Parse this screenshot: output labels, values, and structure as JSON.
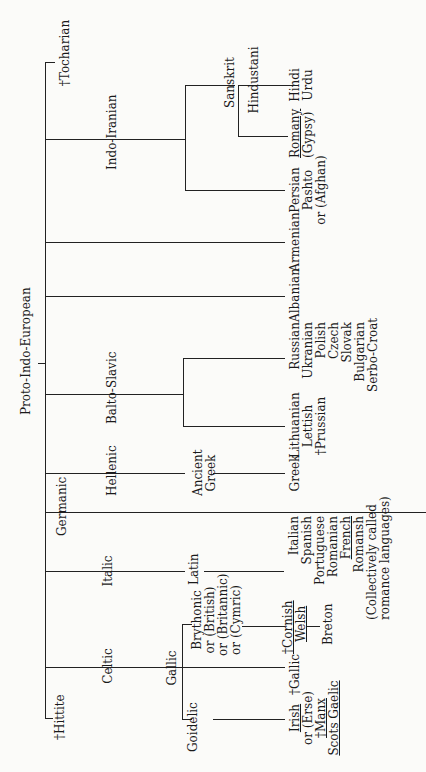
{
  "diagram": {
    "title": "Proto-Indo-European",
    "orientation": "rotated -90deg (root at left, leaves at right)",
    "branches": {
      "tocharian": "†Tocharian",
      "indo_iranian": "Indo-Iranian",
      "sanskrit": "Sanskrit",
      "hindustani": "Hindustani",
      "hindi_urdu": [
        "Hindi",
        "Urdu"
      ],
      "romany": [
        "Romany",
        "(Gypsy)"
      ],
      "persian": [
        "Persian",
        "Pashto",
        "or (Afghan)"
      ],
      "armenian": "Armenian",
      "albanian": "Albanian",
      "balto_slavic": "Balto-Slavic",
      "slavic": [
        "Russian",
        "Ukranian",
        "Polish",
        "Czech",
        "Slovak",
        "Bulgarian",
        "Serbo-Croat"
      ],
      "baltic": [
        "Lithuanian",
        "Lettish",
        "†Prussian"
      ],
      "hellenic": "Hellenic",
      "ancient_greek": [
        "Ancient",
        "Greek"
      ],
      "greek": "Greek",
      "germanic": "Germanic",
      "italic": "Italic",
      "latin": "Latin",
      "romance": [
        "Italian",
        "Spanish",
        "Portuguese",
        "Romanian",
        "French",
        "Romansh",
        "(Collectively called",
        "romance languages)"
      ],
      "celtic": "Celtic",
      "gallic": "Gallic",
      "brythonic": [
        "Brythonic",
        "or (British)",
        "or (Britannic)",
        "or (Cymric)"
      ],
      "cornish_welsh": [
        "†Cornish",
        "Welsh"
      ],
      "breton": "Breton",
      "gallic_extinct": "†Gallic",
      "goidelic": "Goidelic",
      "goidelic_langs": [
        "Irish",
        "or (Erse)",
        "†Manx",
        "Scots Gaelic"
      ],
      "hittite": "†Hittite"
    }
  }
}
